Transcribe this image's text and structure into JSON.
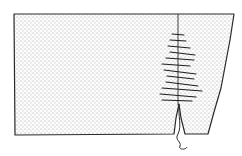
{
  "figure": {
    "type": "illustration",
    "colors": {
      "background": "#ffffff",
      "ink": "#2a2a2a",
      "stipple": "#9a9a9a"
    },
    "fabric_outline": [
      [
        14,
        14
      ],
      [
        234,
        14
      ],
      [
        230,
        40
      ],
      [
        221,
        88
      ],
      [
        214,
        112
      ],
      [
        208,
        134
      ],
      [
        185,
        134
      ],
      [
        181,
        118
      ],
      [
        179,
        104
      ],
      [
        176,
        118
      ],
      [
        174,
        134
      ],
      [
        15,
        135
      ]
    ],
    "seam_line": {
      "x1": 178,
      "y1": 14,
      "x2": 178,
      "y2": 105
    },
    "stitches": [
      {
        "x1": 172,
        "y1": 34,
        "x2": 184,
        "y2": 35
      },
      {
        "x1": 170,
        "y1": 40,
        "x2": 186,
        "y2": 41
      },
      {
        "x1": 168,
        "y1": 46,
        "x2": 190,
        "y2": 48
      },
      {
        "x1": 170,
        "y1": 52,
        "x2": 195,
        "y2": 55
      },
      {
        "x1": 166,
        "y1": 58,
        "x2": 194,
        "y2": 60
      },
      {
        "x1": 162,
        "y1": 64,
        "x2": 190,
        "y2": 66
      },
      {
        "x1": 164,
        "y1": 70,
        "x2": 196,
        "y2": 74
      },
      {
        "x1": 167,
        "y1": 76,
        "x2": 194,
        "y2": 79
      },
      {
        "x1": 166,
        "y1": 82,
        "x2": 198,
        "y2": 86
      },
      {
        "x1": 162,
        "y1": 88,
        "x2": 202,
        "y2": 91
      },
      {
        "x1": 160,
        "y1": 94,
        "x2": 196,
        "y2": 97
      },
      {
        "x1": 162,
        "y1": 100,
        "x2": 192,
        "y2": 101
      }
    ],
    "thread_tail": "M179,104 C178,116 182,126 178,134 C174,140 182,142 180,146 C178,150 186,150 187,147"
  }
}
